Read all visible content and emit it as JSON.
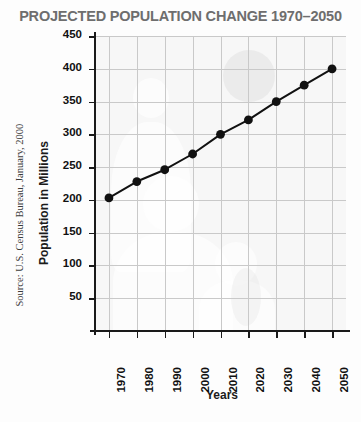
{
  "chart_data": {
    "type": "line",
    "title": "PROJECTED POPULATION CHANGE 1970–2050",
    "xlabel": "Years",
    "ylabel": "Population in Millions",
    "categories": [
      1970,
      1980,
      1990,
      2000,
      2010,
      2020,
      2030,
      2040,
      2050
    ],
    "x_tick_labels": [
      "1970",
      "1980",
      "1990",
      "2000",
      "2010",
      "2020",
      "2030",
      "2040",
      "2050"
    ],
    "values": [
      203,
      228,
      246,
      270,
      300,
      322,
      350,
      375,
      400
    ],
    "y_tick_labels": [
      "50",
      "100",
      "150",
      "200",
      "250",
      "300",
      "350",
      "400",
      "450"
    ],
    "y_ticks": [
      50,
      100,
      150,
      200,
      250,
      300,
      350,
      400,
      450
    ],
    "ylim": [
      0,
      450
    ],
    "xlim": [
      1965,
      2055
    ],
    "grid": true,
    "legend": "none",
    "marker": "filled-circle",
    "line_color": "#111111",
    "marker_color": "#111111",
    "grid_color": "#c9c9c9",
    "plot_background": "#f7f7f7",
    "title_color": "#6e6e6e",
    "series_name": "Projected U.S. population"
  },
  "source": {
    "text": "Source: U.S. Census Bureau, January, 2000"
  }
}
